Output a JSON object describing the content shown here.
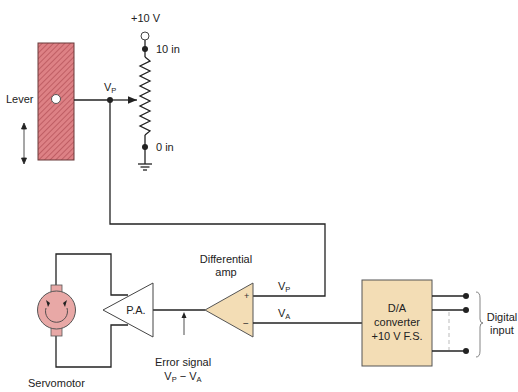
{
  "diagram": {
    "type": "servo-position-control-schematic",
    "supply_label": "+10 V",
    "pot_top_label": "10 in",
    "pot_bottom_label": "0 in",
    "lever_label": "Lever",
    "wiper_voltage": {
      "main": "V",
      "sub": "P"
    },
    "diff_amp_label_line1": "Differential",
    "diff_amp_label_line2": "amp",
    "plus_sign": "+",
    "minus_sign": "−",
    "vp_input": {
      "main": "V",
      "sub": "P"
    },
    "va_input": {
      "main": "V",
      "sub": "A"
    },
    "power_amp_label": "P.A.",
    "error_label_line1": "Error signal",
    "error_label_line2": {
      "a": "V",
      "a_sub": "P",
      "op": " − ",
      "b": "V",
      "b_sub": "A"
    },
    "servomotor_label": "Servomotor",
    "dac_line1": "D/A",
    "dac_line2": "converter",
    "dac_line3": "+10 V F.S.",
    "digital_input_line1": "Digital",
    "digital_input_line2": "input"
  },
  "colors": {
    "lever_fill": "#d9777a",
    "lever_hatch": "#b54f55",
    "amp_fill": "#f3ddb5",
    "dac_fill": "#f3ddb5",
    "motor_fill": "#e8a8a6",
    "wire": "#222222"
  }
}
